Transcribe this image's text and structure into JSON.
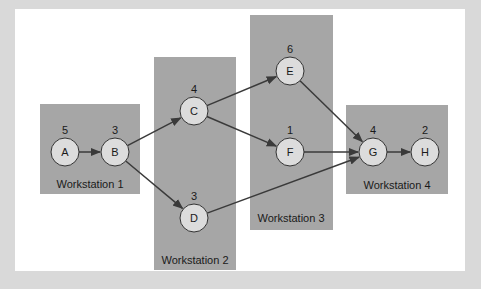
{
  "colors": {
    "outer_background": "#d9d9d9",
    "panel_background": "#ffffff",
    "workstation_fill": "#a6a6a6",
    "node_fill": "#dcdcdc",
    "node_stroke": "#333333",
    "edge": "#3a3a3a",
    "text": "#1a1a1a"
  },
  "workstations": [
    {
      "id": "ws1",
      "label": "Workstation 1",
      "x": 40,
      "y": 104,
      "w": 100,
      "h": 90,
      "label_x": 90,
      "label_y": 188
    },
    {
      "id": "ws2",
      "label": "Workstation 2",
      "x": 154,
      "y": 57,
      "w": 82,
      "h": 213,
      "label_x": 195,
      "label_y": 264
    },
    {
      "id": "ws3",
      "label": "Workstation 3",
      "x": 250,
      "y": 15,
      "w": 83,
      "h": 215,
      "label_x": 291,
      "label_y": 222
    },
    {
      "id": "ws4",
      "label": "Workstation 4",
      "x": 346,
      "y": 105,
      "w": 102,
      "h": 89,
      "label_x": 397,
      "label_y": 189
    }
  ],
  "nodes": [
    {
      "id": "A",
      "label": "A",
      "weight": "5",
      "cx": 65,
      "cy": 152
    },
    {
      "id": "B",
      "label": "B",
      "weight": "3",
      "cx": 115,
      "cy": 152
    },
    {
      "id": "C",
      "label": "C",
      "weight": "4",
      "cx": 194,
      "cy": 111
    },
    {
      "id": "D",
      "label": "D",
      "weight": "3",
      "cx": 194,
      "cy": 218
    },
    {
      "id": "E",
      "label": "E",
      "weight": "6",
      "cx": 290,
      "cy": 71
    },
    {
      "id": "F",
      "label": "F",
      "weight": "1",
      "cx": 290,
      "cy": 152
    },
    {
      "id": "G",
      "label": "G",
      "weight": "4",
      "cx": 373,
      "cy": 152
    },
    {
      "id": "H",
      "label": "H",
      "weight": "2",
      "cx": 425,
      "cy": 152
    }
  ],
  "edges": [
    {
      "from": "A",
      "to": "B"
    },
    {
      "from": "B",
      "to": "C"
    },
    {
      "from": "B",
      "to": "D"
    },
    {
      "from": "C",
      "to": "E"
    },
    {
      "from": "C",
      "to": "F"
    },
    {
      "from": "E",
      "to": "G"
    },
    {
      "from": "F",
      "to": "G"
    },
    {
      "from": "D",
      "to": "G"
    },
    {
      "from": "G",
      "to": "H"
    }
  ],
  "node_radius": 14
}
